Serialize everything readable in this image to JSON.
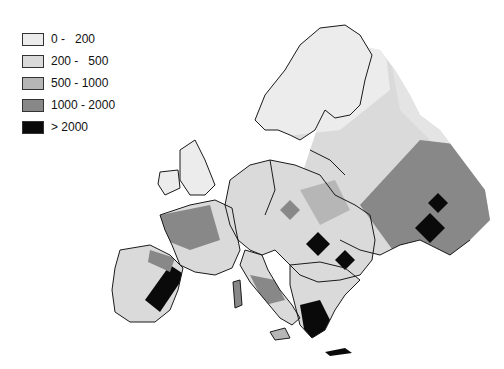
{
  "map": {
    "subject": "Europe choropleth map (grayscale classes)",
    "legend": {
      "items": [
        {
          "label": "0 -   200",
          "color": "#ececec"
        },
        {
          "label": "200 -   500",
          "color": "#dadada"
        },
        {
          "label": "500 - 1000",
          "color": "#b6b6b6"
        },
        {
          "label": "1000 - 2000",
          "color": "#888888"
        },
        {
          "label": "> 2000",
          "color": "#0a0a0a"
        }
      ]
    },
    "colors": {
      "background": "#ffffff",
      "border": "#1a1a1a"
    }
  }
}
